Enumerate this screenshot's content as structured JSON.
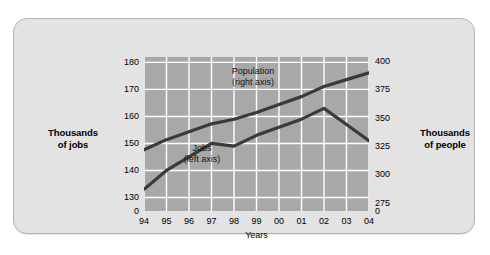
{
  "labels": {
    "left_axis_title_line1": "Thousands",
    "left_axis_title_line2": "of jobs",
    "right_axis_title_line1": "Thousands",
    "right_axis_title_line2": "of people",
    "x_axis_label": "Years",
    "annotation_population_line1": "Population",
    "annotation_population_line2": "(right axis)",
    "annotation_jobs_line1": "Jobs",
    "annotation_jobs_line2": "(left axis)"
  },
  "ticks": {
    "left": [
      "180",
      "170",
      "160",
      "150",
      "140",
      "130",
      "0"
    ],
    "right": [
      "400",
      "375",
      "350",
      "325",
      "300",
      "275",
      "0"
    ],
    "x": [
      "94",
      "95",
      "96",
      "97",
      "98",
      "99",
      "00",
      "01",
      "02",
      "03",
      "04"
    ]
  },
  "colors": {
    "card_background": "#e3e3e3",
    "plot_background": "#a8a8a8",
    "gridline": "#ffffff",
    "line": "#3a3a3a",
    "text": "#000000"
  },
  "chart_data": {
    "type": "line",
    "title": "",
    "xlabel": "Years",
    "ylabel": "Thousands of jobs",
    "y2label": "Thousands of people",
    "x": [
      "94",
      "95",
      "96",
      "97",
      "98",
      "99",
      "00",
      "01",
      "02",
      "03",
      "04"
    ],
    "ylim": [
      125,
      182
    ],
    "y2lim": [
      268,
      404
    ],
    "yticks": [
      130,
      140,
      150,
      160,
      170,
      180
    ],
    "y2ticks": [
      275,
      300,
      325,
      350,
      375,
      400
    ],
    "grid": true,
    "legend": "annotations-inline",
    "series": [
      {
        "name": "Population (right axis)",
        "axis": "right",
        "units": "thousands of people",
        "values": [
          322,
          331,
          338,
          345,
          349,
          355,
          362,
          369,
          378,
          384,
          390
        ]
      },
      {
        "name": "Jobs (left axis)",
        "axis": "left",
        "units": "thousands of jobs",
        "values": [
          133,
          140,
          145,
          150,
          149,
          153,
          156,
          159,
          163,
          157,
          151
        ]
      }
    ]
  }
}
